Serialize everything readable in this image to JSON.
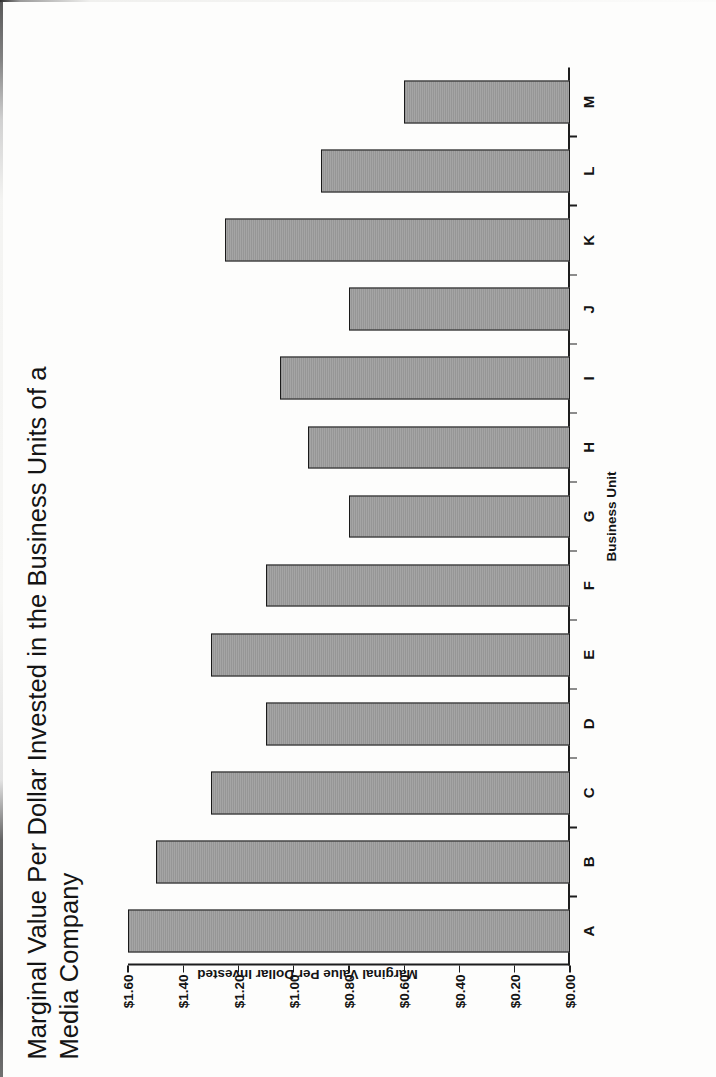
{
  "chart_data": {
    "type": "bar",
    "title": "Marginal Value Per Dollar Invested in the Business Units of a\nMedia Company",
    "xlabel": "Business Unit",
    "ylabel": "Marginal Value Per Dollar Invested",
    "categories": [
      "A",
      "B",
      "C",
      "D",
      "E",
      "F",
      "G",
      "H",
      "I",
      "J",
      "K",
      "L",
      "M"
    ],
    "values": [
      1.6,
      1.5,
      1.3,
      1.1,
      1.3,
      1.1,
      0.8,
      0.95,
      1.05,
      0.8,
      1.25,
      0.9,
      0.6
    ],
    "ylim": [
      0.0,
      1.6
    ],
    "ytick_values": [
      0.0,
      0.2,
      0.4,
      0.6,
      0.8,
      1.0,
      1.2,
      1.4,
      1.6
    ],
    "ytick_labels": [
      "$0.00",
      "$0.20",
      "$0.40",
      "$0.60",
      "$0.80",
      "$1.00",
      "$1.20",
      "$1.40",
      "$1.60"
    ],
    "grid": false,
    "legend": false,
    "orientation": "vertical-bars-rotated-90ccw-on-page",
    "colors": {
      "bar_fill": "#9b9b9b",
      "bar_border": "#1a1a1a",
      "axis": "#1d1d1d",
      "text": "#141414",
      "background": "#fdfdfc"
    }
  }
}
